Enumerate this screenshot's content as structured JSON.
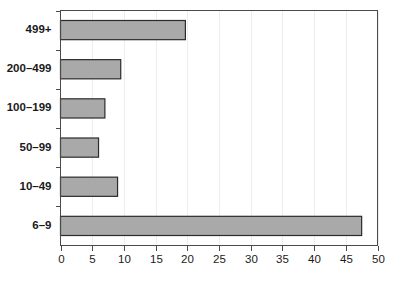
{
  "chart_data": {
    "type": "bar",
    "orientation": "horizontal",
    "title": "",
    "subtitle": "",
    "xlabel": "",
    "ylabel": "",
    "categories": [
      "6–9",
      "10–49",
      "50–99",
      "100–199",
      "200–499",
      "499+"
    ],
    "values": [
      47.5,
      9,
      6,
      7,
      9.5,
      19.7
    ],
    "xlim": [
      0,
      50
    ],
    "x_ticks": [
      0,
      5,
      10,
      15,
      20,
      25,
      30,
      35,
      40,
      45,
      50
    ],
    "x_tick_labels": [
      "0",
      "5",
      "10",
      "15",
      "20",
      "25",
      "30",
      "35",
      "40",
      "45",
      "50"
    ],
    "y_tick_labels": [
      "6–9",
      "10–49",
      "50–99",
      "100–199",
      "200–499",
      "499+"
    ],
    "grid": "faint-vertical",
    "legend": null,
    "legend_position": "none",
    "series": [
      {
        "name": "count",
        "values": [
          47.5,
          9,
          6,
          7,
          9.5,
          19.7
        ]
      }
    ]
  },
  "style": {
    "bar_fill": "#a9a9a9",
    "bar_stroke": "#2b2b2b",
    "axis_color": "#4a4a4a",
    "grid_color": "#ededed",
    "text_color": "#1a1a1a",
    "background": "#ffffff"
  },
  "axes": {
    "x_axis_name": "value-axis",
    "y_axis_name": "category-axis"
  }
}
